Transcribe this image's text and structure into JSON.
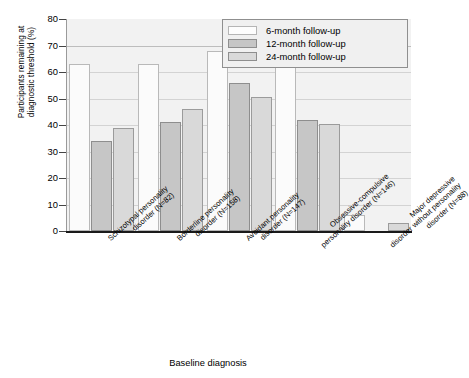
{
  "chart_data": {
    "type": "bar",
    "title": "",
    "xlabel": "Baseline diagnosis",
    "ylabel": "Participants remaining at diagnostic threshold (%)",
    "ylabel_lines": [
      "Participants remaining at",
      "diagnostic threshold (%)"
    ],
    "ylim": [
      0,
      80
    ],
    "yticks": [
      0,
      10,
      20,
      30,
      40,
      50,
      60,
      70,
      80
    ],
    "grid": true,
    "legend_position": "top-right",
    "categories": [
      "Schizotypal personality disorder (N=82)",
      "Borderline personality disorder (N=158)",
      "Avoidant personality disorder (N=147)",
      "Obsessive-compulsive personality disorder (N=146)",
      "Major depressive disorder without personality disorder (N=88)"
    ],
    "category_lines": [
      [
        "Schizotypal personality",
        "disorder (N=82)"
      ],
      [
        "Borderline personality",
        "disorder (N=158)"
      ],
      [
        "Avoidant personality",
        "disorder (N=147)"
      ],
      [
        "Obsessive-compulsive",
        "personality disorder (N=146)"
      ],
      [
        "Major depressive",
        "disorder without personality",
        "disorder (N=88)"
      ]
    ],
    "series": [
      {
        "name": "6-month follow-up",
        "color": "#fbfbfb",
        "values": [
          63,
          63,
          68,
          63,
          6
        ]
      },
      {
        "name": "12-month follow-up",
        "color": "#c6c6c6",
        "values": [
          34,
          41,
          56,
          42,
          0
        ]
      },
      {
        "name": "24-month follow-up",
        "color": "#d9d9d9",
        "values": [
          39,
          46,
          50.5,
          40.5,
          3
        ]
      }
    ]
  },
  "legend": {
    "items": [
      {
        "label": "6-month follow-up"
      },
      {
        "label": "12-month follow-up"
      },
      {
        "label": "24-month follow-up"
      }
    ]
  },
  "axes": {
    "y_tick_labels": [
      "80",
      "70",
      "60",
      "50",
      "40",
      "30",
      "20",
      "10",
      "0"
    ],
    "y_title_line1": "Participants remaining at",
    "y_title_line2": "diagnostic threshold (%)",
    "x_title": "Baseline diagnosis"
  }
}
